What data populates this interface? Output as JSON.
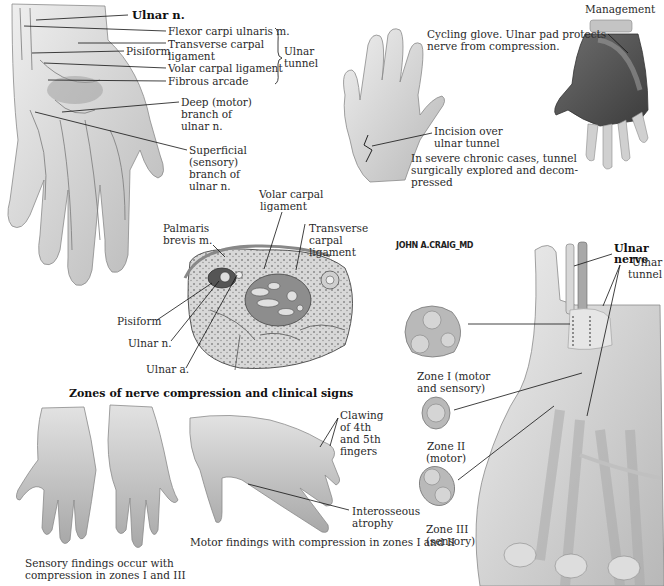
{
  "top_left_panel": {
    "labels": {
      "ulnar_n": "Ulnar n.",
      "fcu": "Flexor carpi ulnaris m.",
      "tcl_1": "Transverse carpal",
      "tcl_2": "ligament",
      "pisiform": "Pisiform",
      "vcl": "Volar carpal ligament",
      "fibrous_arcade": "Fibrous arcade",
      "deep_1": "Deep (motor)",
      "deep_2": "branch of",
      "deep_3": "ulnar n.",
      "sup_1": "Superficial",
      "sup_2": "(sensory)",
      "sup_3": "branch of",
      "sup_4": "ulnar n.",
      "ulnar_tunnel_1": "Ulnar",
      "ulnar_tunnel_2": "tunnel"
    }
  },
  "top_middle_panel": {
    "incision_1": "Incision over",
    "incision_2": "ulnar tunnel",
    "severe_1": "In severe chronic cases, tunnel",
    "severe_2": "surgically explored and decom-",
    "severe_3": "pressed"
  },
  "top_right_panel": {
    "heading": "Management",
    "glove_1": "Cycling glove. Ulnar pad protects",
    "glove_2": "nerve from compression."
  },
  "cross_section": {
    "vcl_1": "Volar carpal",
    "vcl_2": "ligament",
    "palmaris_1": "Palmaris",
    "palmaris_2": "brevis m.",
    "tcl_1": "Transverse",
    "tcl_2": "carpal",
    "tcl_3": "ligament",
    "pisiform": "Pisiform",
    "ulnar_n": "Ulnar n.",
    "ulnar_a": "Ulnar a."
  },
  "signature": "JOHN A.CRAIG_MD",
  "zones_panel": {
    "title": "Zones of nerve compression and clinical signs",
    "sensory_1": "Sensory findings occur with",
    "sensory_2": "compression in zones I and III",
    "claw_1": "Clawing",
    "claw_2": "of 4th",
    "claw_3": "and 5th",
    "claw_4": "fingers",
    "interosseous_1": "Interosseous",
    "interosseous_2": "atrophy",
    "motor": "Motor findings with compression in zones I and II"
  },
  "right_panel": {
    "ulnar_nerve_1": "Ulnar",
    "ulnar_nerve_2": "nerve",
    "ulnar_tunnel_1": "Ulnar",
    "ulnar_tunnel_2": "tunnel",
    "zone1_1": "Zone I (motor",
    "zone1_2": "and sensory)",
    "zone2_1": "Zone II",
    "zone2_2": "(motor)",
    "zone3_1": "Zone III",
    "zone3_2": "(sensory)"
  },
  "colors": {
    "skin_light": "#ededed",
    "skin_mid": "#c9c9c9",
    "skin_dark": "#9a9a9a",
    "line": "#1a1a1a",
    "glove": "#555555"
  }
}
